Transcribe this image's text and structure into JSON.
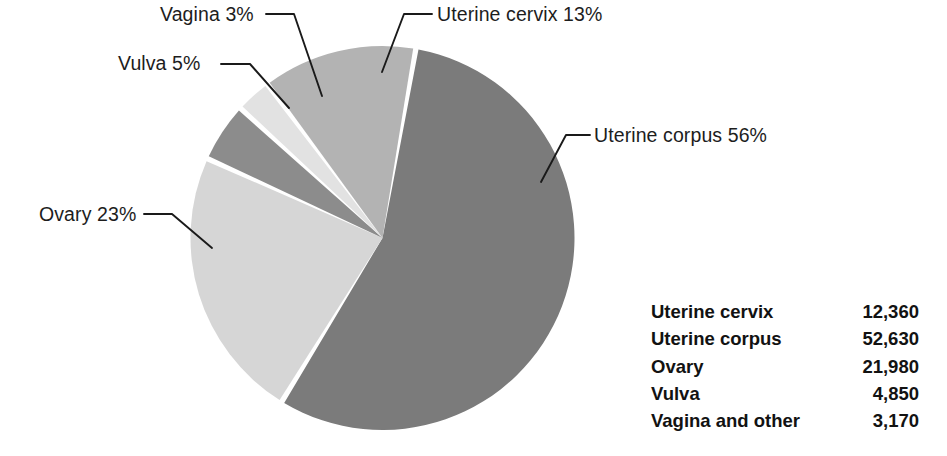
{
  "chart_data": {
    "type": "pie",
    "title": "",
    "subtitle": "",
    "xlabel": "",
    "ylabel": "",
    "legend_position": "bottom-right",
    "grid": false,
    "units": "estimated new cases",
    "categories": [
      "Uterine corpus",
      "Ovary",
      "Vulva",
      "Vagina",
      "Uterine cervix"
    ],
    "percentages": [
      56,
      23,
      5,
      3,
      13
    ],
    "values": [
      52630,
      21980,
      4850,
      3170,
      12360
    ],
    "colors": [
      "#7b7b7b",
      "#d6d6d6",
      "#8c8c8c",
      "#e2e2e2",
      "#b3b3b3"
    ],
    "start_angle_deg": 10,
    "direction": "clockwise",
    "slice_gap_deg": 1.6,
    "separator_color": "#ffffff",
    "slices": [
      {
        "label": "Uterine corpus",
        "percent_text": "56%",
        "percent": 56,
        "value": 52630,
        "color": "#7b7b7b",
        "start_deg": 10,
        "end_deg": 211.6
      },
      {
        "label": "Ovary",
        "percent_text": "23%",
        "percent": 23,
        "value": 21980,
        "color": "#d6d6d6",
        "start_deg": 211.6,
        "end_deg": 294.4
      },
      {
        "label": "Vulva",
        "percent_text": "5%",
        "percent": 5,
        "value": 4850,
        "color": "#8c8c8c",
        "start_deg": 294.4,
        "end_deg": 312.4
      },
      {
        "label": "Vagina",
        "percent_text": "3%",
        "percent": 3,
        "value": 3170,
        "color": "#e2e2e2",
        "start_deg": 312.4,
        "end_deg": 323.2
      },
      {
        "label": "Uterine cervix",
        "percent_text": "13%",
        "percent": 13,
        "value": 12360,
        "color": "#b3b3b3",
        "start_deg": 323.2,
        "end_deg": 370
      }
    ]
  },
  "callouts": {
    "vagina": "Vagina 3%",
    "vulva": "Vulva 5%",
    "uterine_cervix": "Uterine cervix 13%",
    "uterine_corpus": "Uterine corpus 56%",
    "ovary": "Ovary 23%"
  },
  "legend": {
    "rows": [
      {
        "name": "Uterine cervix",
        "value": "12,360"
      },
      {
        "name": "Uterine corpus",
        "value": "52,630"
      },
      {
        "name": "Ovary",
        "value": "21,980"
      },
      {
        "name": "Vulva",
        "value": "4,850"
      },
      {
        "name": "Vagina and other",
        "value": "3,170"
      }
    ]
  },
  "style": {
    "background": "#ffffff",
    "text_color": "#1d1d1d",
    "leader_line_color": "#1a1a1a"
  }
}
